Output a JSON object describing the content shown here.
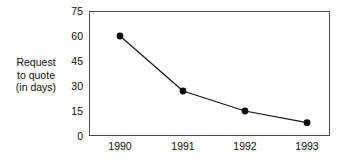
{
  "chart_data": {
    "type": "line",
    "title": "",
    "subtitle": "",
    "xlabel": "",
    "ylabel": "Request to quote (in days)",
    "ylabel_lines": [
      "Request",
      "to quote",
      "(in days)"
    ],
    "categories": [
      "1990",
      "1991",
      "1992",
      "1993"
    ],
    "x": [
      1990,
      1991,
      1992,
      1993
    ],
    "values": [
      60,
      27,
      15,
      8
    ],
    "series": [
      {
        "name": "Request to quote (in days)",
        "values": [
          60,
          27,
          15,
          8
        ],
        "color": "#141414",
        "marker": "circle"
      }
    ],
    "ylim": [
      0,
      75
    ],
    "yticks": [
      0,
      15,
      30,
      45,
      60,
      75
    ],
    "ytick_labels": [
      "0",
      "15",
      "30",
      "45",
      "60",
      "75"
    ],
    "xtick_labels": [
      "1990",
      "1991",
      "1992",
      "1993"
    ],
    "grid": false,
    "legend": false,
    "legend_position": "none",
    "frame": true,
    "annotations": []
  },
  "colors": {
    "line": "#141414",
    "marker": "#0d0d0d",
    "frame": "#4a4a4a",
    "text": "#111111",
    "background": "#ffffff"
  }
}
